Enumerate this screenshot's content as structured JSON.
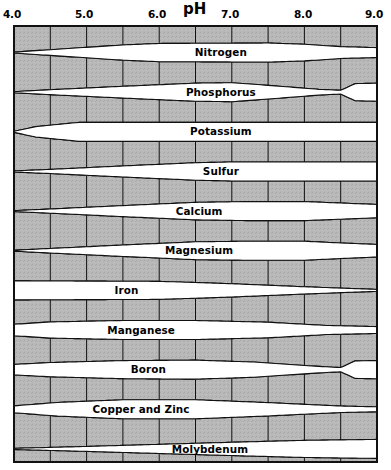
{
  "chart_data": {
    "type": "area",
    "title": "",
    "xlabel": "pH",
    "ylabel": "",
    "xlim": [
      4.0,
      9.0
    ],
    "grid": true,
    "legend_position": "none",
    "tick_labels": [
      "4.0",
      "5.0",
      "6.0",
      "7.0",
      "8.0",
      "9.0"
    ],
    "tick_values": [
      4.0,
      5.0,
      6.0,
      7.0,
      8.0,
      9.0
    ],
    "gridline_values": [
      4.0,
      4.5,
      5.0,
      5.5,
      6.0,
      6.5,
      7.0,
      7.5,
      8.0,
      8.5,
      9.0
    ],
    "series": [
      {
        "name": "Nitrogen",
        "label": "Nitrogen",
        "label_x": 6.85,
        "points": [
          {
            "ph": 4.0,
            "width": 0.05
          },
          {
            "ph": 4.5,
            "width": 0.3
          },
          {
            "ph": 5.5,
            "width": 0.8
          },
          {
            "ph": 6.0,
            "width": 0.96
          },
          {
            "ph": 7.5,
            "width": 1.0
          },
          {
            "ph": 8.0,
            "width": 0.88
          },
          {
            "ph": 8.5,
            "width": 0.62
          },
          {
            "ph": 9.0,
            "width": 0.52
          }
        ]
      },
      {
        "name": "Phosphorus",
        "label": "Phosphorus",
        "label_x": 6.85,
        "points": [
          {
            "ph": 4.0,
            "width": 0.06
          },
          {
            "ph": 4.5,
            "width": 0.26
          },
          {
            "ph": 5.5,
            "width": 0.62
          },
          {
            "ph": 6.5,
            "width": 0.95
          },
          {
            "ph": 7.0,
            "width": 1.0
          },
          {
            "ph": 7.5,
            "width": 0.72
          },
          {
            "ph": 8.2,
            "width": 0.3
          },
          {
            "ph": 8.5,
            "width": 0.2
          },
          {
            "ph": 8.7,
            "width": 0.9
          },
          {
            "ph": 9.0,
            "width": 0.95
          }
        ]
      },
      {
        "name": "Potassium",
        "label": "Potassium",
        "label_x": 6.85,
        "points": [
          {
            "ph": 4.0,
            "width": 0.05
          },
          {
            "ph": 4.3,
            "width": 0.55
          },
          {
            "ph": 4.9,
            "width": 1.0
          },
          {
            "ph": 9.0,
            "width": 1.0
          }
        ]
      },
      {
        "name": "Sulfur",
        "label": "Sulfur",
        "label_x": 6.85,
        "points": [
          {
            "ph": 4.0,
            "width": 0.06
          },
          {
            "ph": 4.5,
            "width": 0.22
          },
          {
            "ph": 5.5,
            "width": 0.58
          },
          {
            "ph": 6.5,
            "width": 0.92
          },
          {
            "ph": 7.0,
            "width": 1.0
          },
          {
            "ph": 9.0,
            "width": 1.0
          }
        ]
      },
      {
        "name": "Calcium",
        "label": "Calcium",
        "label_x": 6.55,
        "points": [
          {
            "ph": 4.0,
            "width": 0.05
          },
          {
            "ph": 4.5,
            "width": 0.22
          },
          {
            "ph": 5.5,
            "width": 0.58
          },
          {
            "ph": 6.5,
            "width": 0.92
          },
          {
            "ph": 7.2,
            "width": 1.0
          },
          {
            "ph": 8.0,
            "width": 1.0
          },
          {
            "ph": 8.5,
            "width": 0.85
          },
          {
            "ph": 9.0,
            "width": 0.7
          }
        ]
      },
      {
        "name": "Magnesium",
        "label": "Magnesium",
        "label_x": 6.55,
        "points": [
          {
            "ph": 4.0,
            "width": 0.05
          },
          {
            "ph": 4.5,
            "width": 0.24
          },
          {
            "ph": 5.5,
            "width": 0.6
          },
          {
            "ph": 6.5,
            "width": 0.94
          },
          {
            "ph": 7.2,
            "width": 1.0
          },
          {
            "ph": 8.0,
            "width": 1.0
          },
          {
            "ph": 8.5,
            "width": 0.82
          },
          {
            "ph": 9.0,
            "width": 0.66
          }
        ]
      },
      {
        "name": "Iron",
        "label": "Iron",
        "label_x": 5.55,
        "points": [
          {
            "ph": 4.0,
            "width": 1.0
          },
          {
            "ph": 6.0,
            "width": 0.95
          },
          {
            "ph": 7.0,
            "width": 0.7
          },
          {
            "ph": 8.0,
            "width": 0.38
          },
          {
            "ph": 9.0,
            "width": 0.1
          }
        ]
      },
      {
        "name": "Manganese",
        "label": "Manganese",
        "label_x": 5.75,
        "points": [
          {
            "ph": 4.0,
            "width": 0.6
          },
          {
            "ph": 4.5,
            "width": 0.85
          },
          {
            "ph": 5.5,
            "width": 1.0
          },
          {
            "ph": 6.5,
            "width": 1.0
          },
          {
            "ph": 7.5,
            "width": 0.82
          },
          {
            "ph": 8.3,
            "width": 0.48
          },
          {
            "ph": 9.0,
            "width": 0.36
          }
        ]
      },
      {
        "name": "Boron",
        "label": "Boron",
        "label_x": 5.85,
        "points": [
          {
            "ph": 4.0,
            "width": 0.55
          },
          {
            "ph": 4.5,
            "width": 0.75
          },
          {
            "ph": 5.5,
            "width": 0.95
          },
          {
            "ph": 6.5,
            "width": 1.0
          },
          {
            "ph": 7.3,
            "width": 0.8
          },
          {
            "ph": 8.2,
            "width": 0.34
          },
          {
            "ph": 8.5,
            "width": 0.22
          },
          {
            "ph": 8.7,
            "width": 0.92
          },
          {
            "ph": 9.0,
            "width": 0.96
          }
        ]
      },
      {
        "name": "Copper and Zinc",
        "label": "Copper and Zinc",
        "label_x": 5.75,
        "points": [
          {
            "ph": 4.0,
            "width": 0.36
          },
          {
            "ph": 4.6,
            "width": 0.72
          },
          {
            "ph": 5.5,
            "width": 1.0
          },
          {
            "ph": 6.5,
            "width": 1.0
          },
          {
            "ph": 7.5,
            "width": 0.7
          },
          {
            "ph": 8.5,
            "width": 0.34
          },
          {
            "ph": 9.0,
            "width": 0.26
          }
        ]
      },
      {
        "name": "Molybdenum",
        "label": "Molybdenum",
        "label_x": 6.7,
        "points": [
          {
            "ph": 4.0,
            "width": 0.06
          },
          {
            "ph": 5.0,
            "width": 0.26
          },
          {
            "ph": 6.0,
            "width": 0.48
          },
          {
            "ph": 7.0,
            "width": 0.7
          },
          {
            "ph": 8.0,
            "width": 0.9
          },
          {
            "ph": 9.0,
            "width": 1.0
          }
        ]
      }
    ]
  },
  "colors": {
    "background": "#ffffff",
    "plot_fill": "#b8b8b8",
    "band_fill": "#ffffff",
    "line": "#111111",
    "text": "#000000"
  }
}
